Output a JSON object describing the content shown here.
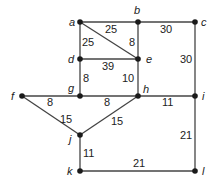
{
  "graph": {
    "nodes": [
      {
        "id": "a",
        "label": "a",
        "x": 80,
        "y": 22,
        "lx": 69,
        "ly": 26
      },
      {
        "id": "b",
        "label": "b",
        "x": 138,
        "y": 22,
        "lx": 134,
        "ly": 14
      },
      {
        "id": "c",
        "label": "c",
        "x": 195,
        "y": 22,
        "lx": 201,
        "ly": 26
      },
      {
        "id": "d",
        "label": "d",
        "x": 80,
        "y": 59,
        "lx": 68,
        "ly": 63
      },
      {
        "id": "e",
        "label": "e",
        "x": 138,
        "y": 59,
        "lx": 146,
        "ly": 63
      },
      {
        "id": "f",
        "label": "f",
        "x": 22,
        "y": 96,
        "lx": 11,
        "ly": 100
      },
      {
        "id": "g",
        "label": "g",
        "x": 80,
        "y": 96,
        "lx": 68,
        "ly": 92
      },
      {
        "id": "h",
        "label": "h",
        "x": 138,
        "y": 96,
        "lx": 143,
        "ly": 93
      },
      {
        "id": "i",
        "label": "i",
        "x": 195,
        "y": 96,
        "lx": 202,
        "ly": 100
      },
      {
        "id": "j",
        "label": "j",
        "x": 80,
        "y": 135,
        "lx": 69,
        "ly": 143
      },
      {
        "id": "k",
        "label": "k",
        "x": 80,
        "y": 171,
        "lx": 67,
        "ly": 175
      },
      {
        "id": "l",
        "label": "l",
        "x": 195,
        "y": 171,
        "lx": 202,
        "ly": 175
      }
    ],
    "edges": [
      {
        "from": "a",
        "to": "b",
        "weight": "25",
        "wx": 105,
        "wy": 33
      },
      {
        "from": "b",
        "to": "c",
        "weight": "30",
        "wx": 160,
        "wy": 33
      },
      {
        "from": "a",
        "to": "e",
        "weight": "8",
        "wx": 129,
        "wy": 46
      },
      {
        "from": "a",
        "to": "d",
        "weight": "25",
        "wx": 82,
        "wy": 46
      },
      {
        "from": "b",
        "to": "e",
        "weight": "",
        "wx": 0,
        "wy": 0
      },
      {
        "from": "d",
        "to": "e",
        "weight": "39",
        "wx": 102,
        "wy": 70
      },
      {
        "from": "c",
        "to": "i",
        "weight": "30",
        "wx": 180,
        "wy": 63
      },
      {
        "from": "d",
        "to": "g",
        "weight": "8",
        "wx": 83,
        "wy": 82
      },
      {
        "from": "e",
        "to": "h",
        "weight": "10",
        "wx": 122,
        "wy": 82
      },
      {
        "from": "f",
        "to": "g",
        "weight": "8",
        "wx": 47,
        "wy": 106
      },
      {
        "from": "g",
        "to": "h",
        "weight": "8",
        "wx": 104,
        "wy": 106
      },
      {
        "from": "h",
        "to": "i",
        "weight": "11",
        "wx": 162,
        "wy": 106
      },
      {
        "from": "f",
        "to": "j",
        "weight": "15",
        "wx": 60,
        "wy": 123
      },
      {
        "from": "h",
        "to": "j",
        "weight": "15",
        "wx": 111,
        "wy": 125
      },
      {
        "from": "i",
        "to": "l",
        "weight": "21",
        "wx": 180,
        "wy": 139
      },
      {
        "from": "j",
        "to": "k",
        "weight": "11",
        "wx": 83,
        "wy": 157
      },
      {
        "from": "k",
        "to": "l",
        "weight": "21",
        "wx": 133,
        "wy": 167
      }
    ]
  }
}
